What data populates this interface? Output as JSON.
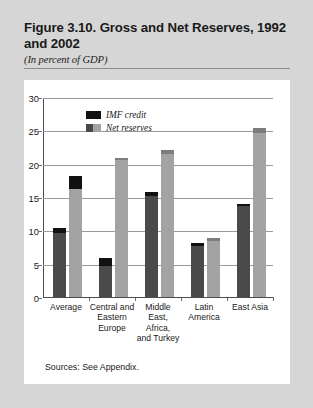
{
  "figure": {
    "title": "Figure 3.10. Gross and Net Reserves, 1992 and 2002",
    "subtitle": "(In percent of GDP)",
    "source": "Sources: See Appendix."
  },
  "colors": {
    "imf_credit": "#111111",
    "net_reserves_1992": "#4a4a4a",
    "net_reserves_2002": "#a3a3a3",
    "page_background": "#d6d6d6",
    "panel_background": "#ffffff",
    "gridline": "#9a9a9a",
    "axis": "#4d4d4d"
  },
  "legend": {
    "position": "top-left-inside",
    "entries": [
      {
        "label": "IMF credit",
        "swatch": "imf_credit"
      },
      {
        "label": "Net reserves",
        "swatch": "net_reserves"
      }
    ]
  },
  "chart_data": {
    "type": "bar",
    "title": "Figure 3.10. Gross and Net Reserves, 1992 and 2002",
    "subtitle": "(In percent of GDP)",
    "xlabel": "",
    "ylabel": "",
    "ylim": [
      0,
      30
    ],
    "yticks": [
      0,
      5,
      10,
      15,
      20,
      25,
      30
    ],
    "ytick_labels": [
      "0",
      "5",
      "10",
      "15",
      "20",
      "25",
      "30"
    ],
    "grid": true,
    "stacked": true,
    "categories": [
      "Average",
      "Central and Eastern Europe",
      "Middle East, Africa, and Turkey",
      "Latin America",
      "East Asia"
    ],
    "category_label_lines": [
      [
        "Average"
      ],
      [
        "Central and",
        "Eastern",
        "Europe"
      ],
      [
        "Middle",
        "East,",
        "Africa,",
        "and Turkey"
      ],
      [
        "Latin",
        "America"
      ],
      [
        "East Asia"
      ]
    ],
    "bars_per_category": 2,
    "bar_years": [
      "1992",
      "2002"
    ],
    "series": [
      {
        "name": "Net reserves",
        "values_1992": [
          9.6,
          4.7,
          15.2,
          7.6,
          13.6
        ],
        "values_2002": [
          16.2,
          20.5,
          21.4,
          8.4,
          24.6
        ]
      },
      {
        "name": "IMF credit",
        "values_1992": [
          0.8,
          1.1,
          0.5,
          0.5,
          0.4
        ],
        "values_2002": [
          2.0,
          0.4,
          0.6,
          0.4,
          0.7
        ]
      }
    ],
    "totals_gross_reserves": {
      "1992": [
        10.4,
        5.8,
        15.7,
        8.1,
        14.0
      ],
      "2002": [
        18.2,
        20.9,
        22.0,
        8.8,
        25.3
      ]
    }
  }
}
